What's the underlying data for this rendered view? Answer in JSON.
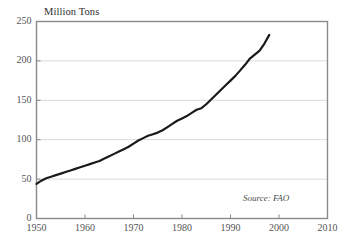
{
  "chart_data": {
    "type": "line",
    "title": "",
    "subtitle": "",
    "ylabel": "Million Tons",
    "xlabel": "",
    "source_note": "Source: FAO",
    "grid": "horizontal",
    "legend": "none",
    "xlim": [
      1950,
      2010
    ],
    "ylim": [
      0,
      250
    ],
    "xticks": [
      "1950",
      "1960",
      "1970",
      "1980",
      "1990",
      "2000",
      "2010"
    ],
    "yticks": [
      "0",
      "50",
      "100",
      "150",
      "200",
      "250"
    ],
    "line_color": "#1a1a1a",
    "grid_color": "#cfcfcf",
    "frame_color": "#8a8a8a",
    "series": [
      {
        "name": "World Production",
        "x": [
          1950,
          1951,
          1952,
          1953,
          1954,
          1955,
          1956,
          1957,
          1958,
          1959,
          1960,
          1961,
          1962,
          1963,
          1964,
          1965,
          1966,
          1967,
          1968,
          1969,
          1970,
          1971,
          1972,
          1973,
          1974,
          1975,
          1976,
          1977,
          1978,
          1979,
          1980,
          1981,
          1982,
          1983,
          1984,
          1985,
          1986,
          1987,
          1988,
          1989,
          1990,
          1991,
          1992,
          1993,
          1994,
          1995,
          1996,
          1997,
          1998
        ],
        "values": [
          44,
          48,
          51,
          53,
          55,
          57,
          59,
          61,
          63,
          65,
          67,
          69,
          71,
          73,
          76,
          79,
          82,
          85,
          88,
          91,
          95,
          99,
          102,
          105,
          107,
          109,
          112,
          116,
          120,
          124,
          127,
          130,
          134,
          138,
          140,
          145,
          151,
          157,
          163,
          169,
          175,
          181,
          188,
          195,
          203,
          208,
          213,
          222,
          233
        ]
      }
    ]
  }
}
